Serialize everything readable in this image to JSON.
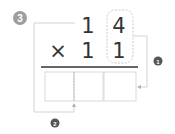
{
  "problem": {
    "step_badge": "3",
    "top_row": [
      "1",
      "4"
    ],
    "bottom_row": [
      "×",
      "1",
      "1"
    ],
    "answer_boxes": [
      "",
      "",
      ""
    ]
  },
  "callouts": [
    {
      "label": "1"
    },
    {
      "label": "2"
    }
  ],
  "colors": {
    "step_badge": "#9e9e9e",
    "callout_badge": "#555555",
    "digit": "#333333",
    "line": "#333333",
    "guide": "#bdbdbd"
  }
}
